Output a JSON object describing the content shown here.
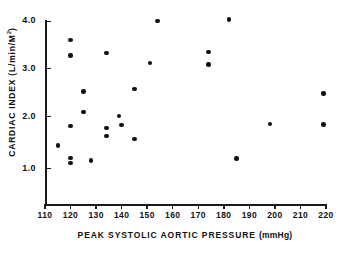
{
  "chart_data": {
    "type": "scatter",
    "title": "",
    "xlabel": "PEAK SYSTOLIC AORTIC PRESSURE (mmHg)",
    "ylabel": "CARDIAC INDEX (L/min/M2)",
    "ylabel_main": "CARDIAC  INDEX  (L/min/M",
    "ylabel_sup": "2",
    "ylabel_close": ")",
    "xlabel_main": "PEAK  SYSTOLIC  AORTIC  PRESSURE ",
    "xlabel_unit": "(mmHg)",
    "xlim": [
      110,
      220
    ],
    "ylim": [
      0.55,
      4.15
    ],
    "grid": false,
    "legend": false,
    "xticks": [
      110,
      120,
      130,
      140,
      150,
      160,
      170,
      180,
      190,
      200,
      210,
      220
    ],
    "xtick_labels": [
      "110",
      "120",
      "130",
      "140",
      "150",
      "160",
      "170",
      "180",
      "190",
      "200",
      "210",
      "220"
    ],
    "yticks": [
      1.0,
      2.0,
      3.0,
      4.0
    ],
    "ytick_labels": [
      "1.0",
      "2.0",
      "3.0",
      "4.0"
    ],
    "marker": "filled-circle",
    "marker_color": "#111111",
    "points": [
      {
        "x": 115,
        "y": 1.43
      },
      {
        "x": 120,
        "y": 3.58
      },
      {
        "x": 120,
        "y": 3.27
      },
      {
        "x": 120,
        "y": 1.83
      },
      {
        "x": 120,
        "y": 1.18
      },
      {
        "x": 120,
        "y": 1.07
      },
      {
        "x": 125,
        "y": 2.53
      },
      {
        "x": 125,
        "y": 2.12
      },
      {
        "x": 128,
        "y": 1.13
      },
      {
        "x": 134,
        "y": 3.32
      },
      {
        "x": 134,
        "y": 1.79
      },
      {
        "x": 134,
        "y": 1.62
      },
      {
        "x": 139,
        "y": 2.03
      },
      {
        "x": 140,
        "y": 1.85
      },
      {
        "x": 145,
        "y": 2.59
      },
      {
        "x": 145,
        "y": 1.57
      },
      {
        "x": 151,
        "y": 3.12
      },
      {
        "x": 154,
        "y": 3.97
      },
      {
        "x": 174,
        "y": 3.34
      },
      {
        "x": 174,
        "y": 3.08
      },
      {
        "x": 182,
        "y": 4.0
      },
      {
        "x": 185,
        "y": 1.17
      },
      {
        "x": 198,
        "y": 1.87
      },
      {
        "x": 219,
        "y": 2.49
      },
      {
        "x": 219,
        "y": 1.86
      }
    ]
  }
}
